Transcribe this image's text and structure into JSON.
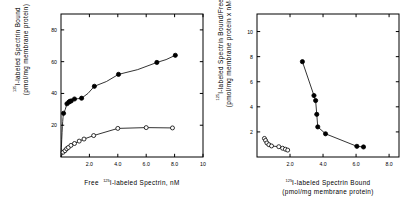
{
  "figure": {
    "background_color": "#ffffff",
    "ink_color": "#000000",
    "panel_count": 2
  },
  "chart_data": [
    {
      "panel": "left",
      "type": "scatter",
      "title": "",
      "xlabel_parts": {
        "prefix": "Free",
        "superscript": "125",
        "suffix": "I-labeled Spectrin, nM"
      },
      "xlabel": "Free 125I-labeled Spectrin, nM",
      "ylabel_parts": {
        "superscript": "125",
        "line1": "I-labeled Spectrin Bound",
        "line2": "(pmol/mg membrane protein)"
      },
      "ylabel": "125I-labeled Spectrin Bound (pmol/mg membrane protein)",
      "xlim": [
        0,
        10
      ],
      "ylim": [
        0,
        90
      ],
      "xticks": [
        2.0,
        4.0,
        6.0,
        8.0,
        10
      ],
      "xticklabels": [
        "2.0",
        "4.0",
        "6.0",
        "8.0",
        "10"
      ],
      "yticks": [
        20,
        40,
        60,
        80
      ],
      "yticklabels": [
        "20",
        "40",
        "60",
        "80"
      ],
      "grid": false,
      "frame": "box",
      "legend": "none",
      "series": [
        {
          "name": "Total binding",
          "marker": "filled-circle",
          "marker_fill": "#000000",
          "x": [
            0.18,
            0.42,
            0.55,
            0.62,
            0.72,
            0.95,
            1.45,
            2.35,
            4.05,
            6.75,
            8.05
          ],
          "y": [
            27.5,
            33.5,
            34.5,
            35.0,
            35.3,
            36.5,
            37.0,
            44.5,
            52.0,
            59.5,
            64.0
          ]
        },
        {
          "name": "Nonspecific binding",
          "marker": "open-circle",
          "marker_fill": "#ffffff",
          "x": [
            0.15,
            0.28,
            0.4,
            0.52,
            0.7,
            0.95,
            1.28,
            1.62,
            2.3,
            4.0,
            6.0,
            7.85
          ],
          "y": [
            3.0,
            4.0,
            5.2,
            6.0,
            7.3,
            8.5,
            10.0,
            11.3,
            13.5,
            18.0,
            18.5,
            18.3
          ]
        }
      ]
    },
    {
      "panel": "right",
      "type": "scatter",
      "title": "",
      "xlabel_parts": {
        "superscript": "125",
        "line1": "I-labeled Spectrin Bound",
        "line2": "(pmol/mg membrane protein)"
      },
      "xlabel": "125I-labeled Spectrin Bound (pmol/mg membrane protein)",
      "ylabel_parts": {
        "superscript": "125",
        "line1": "I-labeled Spectrin Bound/Free",
        "line2": "(pmol/mg membrane protein x nM-1)"
      },
      "ylabel": "125I-labeled Spectrin Bound/Free (pmol/mg membrane protein x nM-1)",
      "xlim": [
        0,
        8.6
      ],
      "ylim": [
        0,
        11.4
      ],
      "xticks": [
        2.0,
        4.0,
        6.0,
        8.0
      ],
      "xticklabels": [
        "2.0",
        "4.0",
        "6.0",
        "8.0"
      ],
      "yticks": [
        2,
        4,
        6,
        8,
        10
      ],
      "yticklabels": [
        "2",
        "4",
        "6",
        "8",
        "10"
      ],
      "grid": false,
      "frame": "box",
      "legend": "none",
      "series": [
        {
          "name": "Specific binding Scatchard",
          "marker": "filled-circle",
          "marker_fill": "#000000",
          "x": [
            2.75,
            3.45,
            3.55,
            3.62,
            3.68,
            4.15,
            6.05,
            6.45
          ],
          "y": [
            7.6,
            4.9,
            4.5,
            3.4,
            2.4,
            1.85,
            0.85,
            0.8
          ]
        },
        {
          "name": "Nonspecific binding Scatchard",
          "marker": "open-circle",
          "marker_fill": "#ffffff",
          "x": [
            0.45,
            0.52,
            0.6,
            0.72,
            0.88,
            1.32,
            1.55,
            1.72,
            1.86
          ],
          "y": [
            1.48,
            1.32,
            1.12,
            0.98,
            0.88,
            0.82,
            0.7,
            0.62,
            0.55
          ]
        }
      ]
    }
  ]
}
